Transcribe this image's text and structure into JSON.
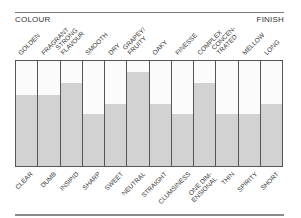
{
  "header": {
    "left_label": "COLOUR",
    "right_label": "FINISH"
  },
  "colors": {
    "fill": "#d2d2d2",
    "border": "#555555",
    "empty": "#fbfbfb"
  },
  "chart_data": {
    "type": "bar",
    "title": "",
    "subtitle": "Wine tasting profile: high attribute (top) vs low attribute (bottom)",
    "top_labels": [
      "GOLDEN",
      "FRAGRANT",
      "STRONG FLAVOUR",
      "SMOOTH",
      "DRY",
      "GRAPEY/ FRUITY",
      "OAKY",
      "FINESSE",
      "COMPLEX",
      "CONCEN- TRATED",
      "MELLOW",
      "LONG"
    ],
    "bottom_labels": [
      "CLEAR",
      "DUMB",
      "INSIPID",
      "SHARP",
      "SWEET",
      "NEUTRAL",
      "STRAIGHT",
      "CLUMSINESS",
      "ONE DIM- ENSIONAL",
      "THIN",
      "SPIRITY",
      "SHORT"
    ],
    "categories": [
      "GOLDEN/CLEAR",
      "FRAGRANT/DUMB",
      "STRONG FLAVOUR/INSIPID",
      "SMOOTH/SHARP",
      "DRY/SWEET",
      "GRAPEY FRUITY/NEUTRAL",
      "OAKY/STRAIGHT",
      "FINESSE/CLUMSINESS",
      "COMPLEX/ONE DIMENSIONAL",
      "CONCENTRATED/THIN",
      "MELLOW/SPIRITY",
      "LONG/SHORT"
    ],
    "values": [
      68,
      68,
      79,
      50,
      59,
      90,
      59,
      50,
      79,
      50,
      50,
      59
    ],
    "ylim": [
      0,
      100
    ],
    "xlabel": "",
    "ylabel": "",
    "grid": false,
    "legend": "none"
  },
  "columns": [
    {
      "top": [
        "GOLDEN"
      ],
      "bottom": [
        "CLEAR"
      ],
      "value": 68
    },
    {
      "top": [
        "FRAGRANT"
      ],
      "bottom": [
        "DUMB"
      ],
      "value": 68
    },
    {
      "top": [
        "STRONG",
        "FLAVOUR"
      ],
      "bottom": [
        "INSIPID"
      ],
      "value": 79
    },
    {
      "top": [
        "SMOOTH"
      ],
      "bottom": [
        "SHARP"
      ],
      "value": 50
    },
    {
      "top": [
        "DRY"
      ],
      "bottom": [
        "SWEET"
      ],
      "value": 59
    },
    {
      "top": [
        "GRAPEY/",
        "FRUITY"
      ],
      "bottom": [
        "NEUTRAL"
      ],
      "value": 90
    },
    {
      "top": [
        "OAKY"
      ],
      "bottom": [
        "STRAIGHT"
      ],
      "value": 59
    },
    {
      "top": [
        "FINESSE"
      ],
      "bottom": [
        "CLUMSINESS"
      ],
      "value": 50
    },
    {
      "top": [
        "COMPLEX"
      ],
      "bottom": [
        "ONE DIM-",
        "ENSIONAL"
      ],
      "value": 79
    },
    {
      "top": [
        "CONCEN-",
        "TRATED"
      ],
      "bottom": [
        "THIN"
      ],
      "value": 50
    },
    {
      "top": [
        "MELLOW"
      ],
      "bottom": [
        "SPIRITY"
      ],
      "value": 50
    },
    {
      "top": [
        "LONG"
      ],
      "bottom": [
        "SHORT"
      ],
      "value": 59
    }
  ]
}
